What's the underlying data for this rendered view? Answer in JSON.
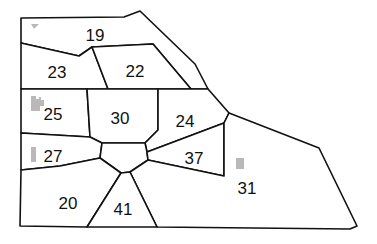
{
  "map": {
    "title": "Numbered zone map",
    "colors": {
      "line": "#111111",
      "fill": "#ffffff",
      "marker": "#b9b9b9"
    },
    "regions": [
      {
        "id": "19",
        "label": "19",
        "label_pos": [
          95,
          35
        ]
      },
      {
        "id": "23",
        "label": "23",
        "label_pos": [
          57,
          72
        ]
      },
      {
        "id": "22",
        "label": "22",
        "label_pos": [
          135,
          71
        ]
      },
      {
        "id": "25",
        "label": "25",
        "label_pos": [
          53,
          114
        ]
      },
      {
        "id": "30",
        "label": "30",
        "label_pos": [
          120,
          118
        ]
      },
      {
        "id": "24",
        "label": "24",
        "label_pos": [
          185,
          121
        ]
      },
      {
        "id": "27",
        "label": "27",
        "label_pos": [
          53,
          156
        ]
      },
      {
        "id": "37",
        "label": "37",
        "label_pos": [
          194,
          158
        ]
      },
      {
        "id": "31",
        "label": "31",
        "label_pos": [
          247,
          188
        ]
      },
      {
        "id": "20",
        "label": "20",
        "label_pos": [
          68,
          203
        ]
      },
      {
        "id": "41",
        "label": "41",
        "label_pos": [
          123,
          209
        ]
      }
    ],
    "markers": [
      {
        "region": "19",
        "shape": "triangle"
      },
      {
        "region": "25",
        "shape": "building"
      },
      {
        "region": "27",
        "shape": "bar"
      },
      {
        "region": "31",
        "shape": "square"
      }
    ]
  }
}
